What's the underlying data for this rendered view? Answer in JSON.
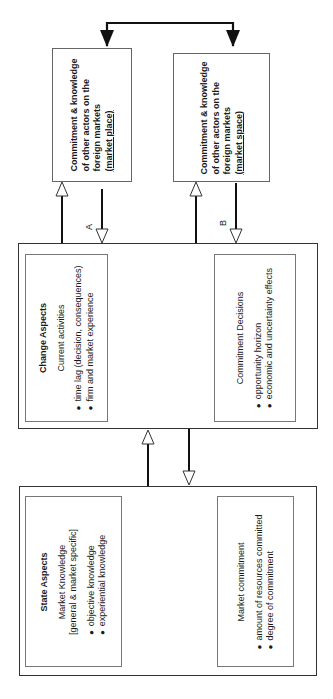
{
  "market_place_box": {
    "lines": [
      "Commitment & knowledge",
      "of other actors on the",
      "foreign markets"
    ],
    "tag": "(market place)"
  },
  "market_space_box": {
    "lines": [
      "Commitment & knowledge",
      "of other actors on the",
      "foreign markets"
    ],
    "tag": "(market space)"
  },
  "arrow_labels": {
    "a": "A",
    "b": "B"
  },
  "change_aspects": {
    "title": "Change Aspects",
    "current_activities": {
      "heading": "Current activities",
      "bullets": [
        "time lag (decision, consequences)",
        "firm and market experience"
      ]
    },
    "commitment_decisions": {
      "heading": "Commitment Decisions",
      "bullets": [
        "opportunity horizon",
        "economic and uncertainty effects"
      ]
    }
  },
  "state_aspects": {
    "title": "State Aspects",
    "market_knowledge": {
      "heading": "Market Knowledge",
      "subheading": "[general & market specific]",
      "bullets": [
        "objective knowledge",
        "experiential knowledge"
      ]
    },
    "market_commitment": {
      "heading": "Market commitment",
      "bullets": [
        "amount of resources committed",
        "degree of commitment"
      ]
    }
  },
  "colors": {
    "line": "#111111",
    "box_border": "#333333",
    "inner_border": "#777777"
  }
}
